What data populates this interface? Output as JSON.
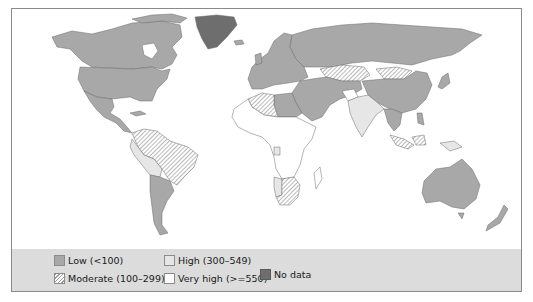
{
  "map": {
    "title": "",
    "description": "World choropleth map with five rate categories shaded by country",
    "colors": {
      "low": "#a8a8a8",
      "moderate_hatch": "#9a9a9a",
      "high": "#e6e6e6",
      "very_high": "#ffffff",
      "no_data": "#6e6e6e",
      "border": "#6a6a6a",
      "legend_background": "#dcdcdc"
    },
    "regions": [
      {
        "name": "North America (Canada, USA, Mexico)",
        "category": "Low"
      },
      {
        "name": "Greenland",
        "category": "No data"
      },
      {
        "name": "Central America & Caribbean",
        "category": "Low"
      },
      {
        "name": "Brazil / Colombia / Venezuela",
        "category": "Moderate"
      },
      {
        "name": "Peru / Bolivia",
        "category": "High"
      },
      {
        "name": "Argentina / Chile",
        "category": "Low"
      },
      {
        "name": "Europe & Russia",
        "category": "Low"
      },
      {
        "name": "Kazakhstan / Mongolia",
        "category": "Moderate"
      },
      {
        "name": "China",
        "category": "Low"
      },
      {
        "name": "India / Pakistan",
        "category": "High"
      },
      {
        "name": "Afghanistan",
        "category": "Very high"
      },
      {
        "name": "North Africa & Middle East",
        "category": "Low"
      },
      {
        "name": "Algeria",
        "category": "Moderate"
      },
      {
        "name": "Sub-Saharan Africa",
        "category": "Very high"
      },
      {
        "name": "Southern Africa (South Africa)",
        "category": "Moderate"
      },
      {
        "name": "Namibia / Gabon",
        "category": "High"
      },
      {
        "name": "Southeast Asia",
        "category": "Low"
      },
      {
        "name": "Indonesia / Papua New Guinea",
        "category": "Moderate"
      },
      {
        "name": "Australia / New Zealand",
        "category": "Low"
      }
    ]
  },
  "legend": {
    "items": [
      {
        "key": "low",
        "label": "Low (<100)"
      },
      {
        "key": "high",
        "label": "High (300–549)"
      },
      {
        "key": "moderate",
        "label": "Moderate (100–299)"
      },
      {
        "key": "very_high",
        "label": "Very high (>=550)"
      },
      {
        "key": "no_data",
        "label": "No data"
      }
    ]
  }
}
